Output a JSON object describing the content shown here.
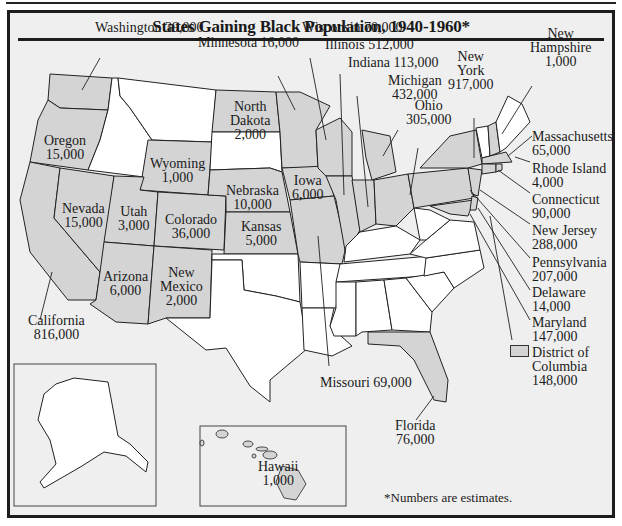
{
  "title": "States Gaining Black Population, 1940-1960*",
  "footnote": "*Numbers are estimates.",
  "colors": {
    "gaining": "#d4d4d4",
    "not_gaining": "#ffffff",
    "background": "#efefef",
    "border": "#1d1d1d"
  },
  "legend": {
    "label_line1": "District of",
    "label_line2": "Columbia",
    "value": "148,000"
  },
  "states": {
    "washington": {
      "name": "Washington",
      "value": "39,000"
    },
    "minnesota": {
      "name": "Minnesota",
      "value": "16,000"
    },
    "wisconsin": {
      "name": "Wisconsin",
      "value": "70,000"
    },
    "illinois": {
      "name": "Illinois",
      "value": "512,000"
    },
    "indiana": {
      "name": "Indiana",
      "value": "113,000"
    },
    "michigan": {
      "name": "Michigan",
      "value": "432,000"
    },
    "new_york": {
      "name_line1": "New",
      "name_line2": "York",
      "value": "917,000"
    },
    "new_hampshire": {
      "name_line1": "New",
      "name_line2": "Hampshire",
      "value": "1,000"
    },
    "massachusetts": {
      "name": "Massachusetts",
      "value": "65,000"
    },
    "rhode_island": {
      "name": "Rhode Island",
      "value": "4,000"
    },
    "connecticut": {
      "name": "Connecticut",
      "value": "90,000"
    },
    "new_jersey": {
      "name": "New Jersey",
      "value": "288,000"
    },
    "pennsylvania": {
      "name": "Pennsylvania",
      "value": "207,000"
    },
    "delaware": {
      "name": "Delaware",
      "value": "14,000"
    },
    "maryland": {
      "name": "Maryland",
      "value": "147,000"
    },
    "ohio": {
      "name": "Ohio",
      "value": "305,000"
    },
    "north_dakota": {
      "name_line1": "North",
      "name_line2": "Dakota",
      "value": "2,000"
    },
    "oregon": {
      "name": "Oregon",
      "value": "15,000"
    },
    "wyoming": {
      "name": "Wyoming",
      "value": "1,000"
    },
    "iowa": {
      "name": "Iowa",
      "value": "6,000"
    },
    "nebraska": {
      "name": "Nebraska",
      "value": "10,000"
    },
    "nevada": {
      "name": "Nevada",
      "value": "15,000"
    },
    "utah": {
      "name": "Utah",
      "value": "3,000"
    },
    "colorado": {
      "name": "Colorado",
      "value": "36,000"
    },
    "kansas": {
      "name": "Kansas",
      "value": "5,000"
    },
    "arizona": {
      "name": "Arizona",
      "value": "6,000"
    },
    "new_mexico": {
      "name_line1": "New",
      "name_line2": "Mexico",
      "value": "2,000"
    },
    "california": {
      "name": "California",
      "value": "816,000"
    },
    "missouri": {
      "name": "Missouri",
      "value": "69,000"
    },
    "florida": {
      "name": "Florida",
      "value": "76,000"
    },
    "hawaii": {
      "name": "Hawaii",
      "value": "1,000"
    }
  }
}
